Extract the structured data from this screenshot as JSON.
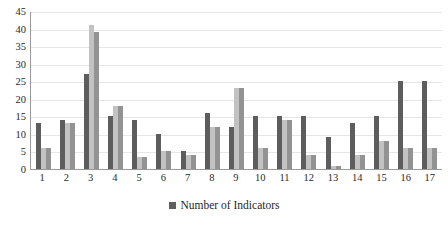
{
  "chart_data": {
    "type": "bar",
    "title": "",
    "xlabel": "",
    "ylabel": "",
    "ylim": [
      0,
      45
    ],
    "ytick_step": 5,
    "yticks": [
      45,
      40,
      35,
      30,
      25,
      20,
      15,
      10,
      5,
      0
    ],
    "grid": true,
    "legend_position": "bottom",
    "categories": [
      "1",
      "2",
      "3",
      "4",
      "5",
      "6",
      "7",
      "8",
      "9",
      "10",
      "11",
      "12",
      "13",
      "14",
      "15",
      "16",
      "17"
    ],
    "legend": [
      "Number of Indicators"
    ],
    "series": [
      {
        "name": "Number of Indicators",
        "color": "#5d5d5d",
        "values": [
          13,
          14,
          27,
          15,
          14,
          10,
          5,
          16,
          12,
          15,
          15,
          15,
          9,
          13,
          15,
          25,
          25
        ]
      },
      {
        "name": "Series 2",
        "color": "#c2c2c2",
        "values": [
          6,
          13,
          41,
          18,
          3.5,
          5,
          4,
          12,
          23,
          6,
          14,
          4,
          1,
          4,
          8,
          6,
          6
        ]
      },
      {
        "name": "Series 3",
        "color": "#939393",
        "values": [
          6,
          13,
          39,
          18,
          3.5,
          5,
          4,
          12,
          23,
          6,
          14,
          4,
          1,
          4,
          8,
          6,
          6
        ]
      }
    ]
  },
  "legend": {
    "items": [
      {
        "label": "Number of Indicators",
        "color": "#5d5d5d"
      }
    ]
  }
}
